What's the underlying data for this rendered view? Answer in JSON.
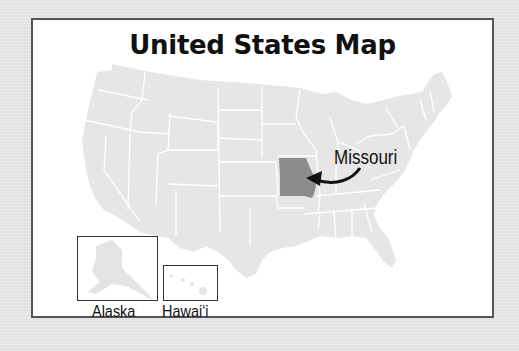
{
  "title": "United States Map",
  "highlighted_state": {
    "name": "Missouri",
    "label": "Missouri",
    "color": "#8c8c8c"
  },
  "colors": {
    "page_background": "#e3e3e3",
    "card_background": "#ffffff",
    "card_border": "#555555",
    "state_fill": "#e6e6e6",
    "state_border": "#ffffff",
    "highlight_fill": "#8c8c8c",
    "arrow": "#111111"
  },
  "insets": [
    {
      "name": "Alaska",
      "label": "Alaska"
    },
    {
      "name": "Hawaii",
      "label": "Hawai‘i"
    }
  ]
}
